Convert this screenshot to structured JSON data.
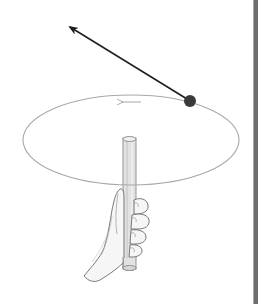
{
  "figure": {
    "description": "Ball on a string swung in a horizontal circle by a hand holding a tube; arrow shows tangential velocity",
    "labels": [],
    "colors": {
      "background": "#ffffff",
      "orbit": "#a8a8a8",
      "ball": "#3a3a3a",
      "velocity_arrow": "#1e1e1e",
      "tube_fill": "#dedede",
      "tube_stroke": "#8a8a8a",
      "hand_stroke": "#6a6a6a",
      "edge_bar": "#6e6e6e"
    },
    "elements": {
      "orbit": {
        "cx": 131,
        "cy": 140,
        "rx": 108,
        "ry": 45
      },
      "ball": {
        "cx": 190,
        "cy": 101,
        "r": 6
      },
      "velocity_arrow": {
        "x1": 187,
        "y1": 99,
        "x2": 69,
        "y2": 26
      },
      "direction_arrow": {
        "x1": 140,
        "y1": 102,
        "x2": 121,
        "y2": 102
      },
      "tube": {
        "x": 123,
        "y": 138,
        "width": 13,
        "height": 131
      }
    }
  }
}
